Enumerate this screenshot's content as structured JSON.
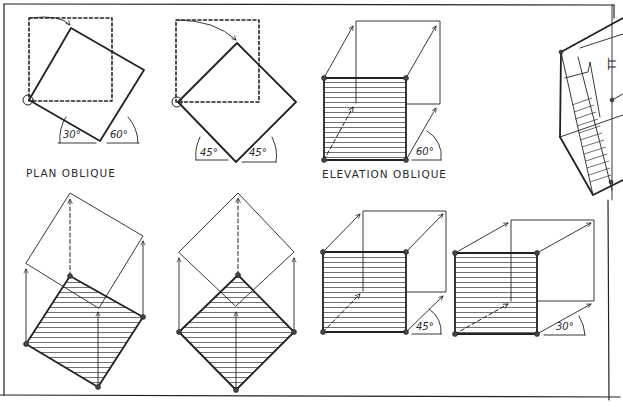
{
  "drawing": {
    "title": "Plan oblique and elevation oblique construction",
    "labels": {
      "plan_oblique": "PLAN OBLIQUE",
      "elevation_oblique": "ELEVATION OBLIQUE"
    },
    "angles": {
      "plan_a_left": "30°",
      "plan_a_right": "60°",
      "plan_b_left": "45°",
      "plan_b_right": "45°",
      "elev_a": "60°",
      "elev_b": "45°",
      "elev_c": "30°"
    },
    "colors": {
      "ink": "#222222",
      "paper": "#ffffff"
    },
    "figures": [
      {
        "id": "plan-oblique-30-60-rotation",
        "row": 1,
        "col": 1
      },
      {
        "id": "plan-oblique-45-45-rotation",
        "row": 1,
        "col": 2
      },
      {
        "id": "elevation-oblique-60",
        "row": 1,
        "col": 3
      },
      {
        "id": "stair-section-partial",
        "row": 1,
        "col": 4
      },
      {
        "id": "plan-oblique-30-60-extrusion",
        "row": 2,
        "col": 1
      },
      {
        "id": "plan-oblique-45-45-extrusion",
        "row": 2,
        "col": 2
      },
      {
        "id": "elevation-oblique-45",
        "row": 2,
        "col": 3
      },
      {
        "id": "elevation-oblique-30",
        "row": 2,
        "col": 4
      }
    ]
  }
}
